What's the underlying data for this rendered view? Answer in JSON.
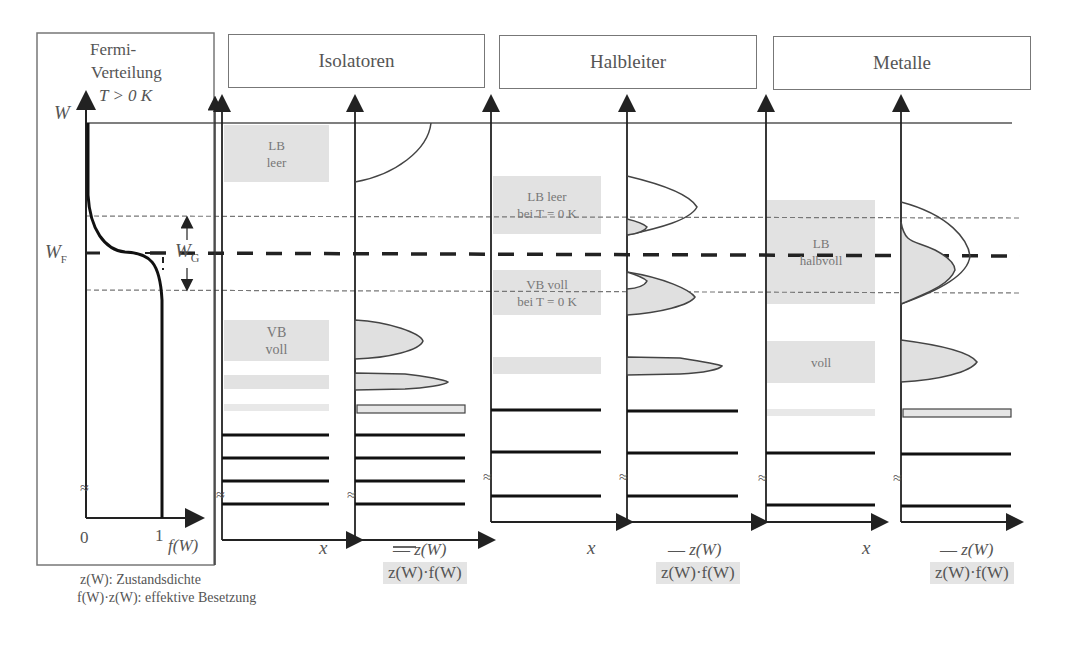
{
  "fermi_panel": {
    "title_line1": "Fermi-",
    "title_line2": "Verteilung",
    "temperature": "T > 0 K",
    "axis_y": "W",
    "fermi_level": "W",
    "fermi_level_sub": "F",
    "gap": "W",
    "gap_sub": "G",
    "x_tick_0": "0",
    "x_tick_1": "1",
    "x_label": "f(W)",
    "break_mark": "≈"
  },
  "footnote": {
    "line1": "z(W): Zustandsdichte",
    "line2": "f(W)·z(W): effektive Besetzung"
  },
  "sections": [
    {
      "title": "Isolatoren",
      "x_axis_label": "x",
      "legend_line": "z(W)",
      "legend_fill": "z(W)·f(W)",
      "bands": [
        {
          "line1": "LB",
          "line2": "leer"
        },
        {
          "line1": "VB",
          "line2": "voll"
        }
      ]
    },
    {
      "title": "Halbleiter",
      "x_axis_label": "x",
      "legend_line": "z(W)",
      "legend_fill": "z(W)·f(W)",
      "bands": [
        {
          "line1": "LB leer",
          "line2": "bei T = 0 K"
        },
        {
          "line1": "VB voll",
          "line2": "bei T = 0 K"
        }
      ]
    },
    {
      "title": "Metalle",
      "x_axis_label": "x",
      "legend_line": "z(W)",
      "legend_fill": "z(W)·f(W)",
      "bands": [
        {
          "line1": "LB",
          "line2": "halbvoll"
        },
        {
          "line1": "voll",
          "line2": ""
        }
      ]
    }
  ],
  "colors": {
    "line": "#333333",
    "band_fill": "#e2e2e2",
    "frame": "#777777"
  }
}
